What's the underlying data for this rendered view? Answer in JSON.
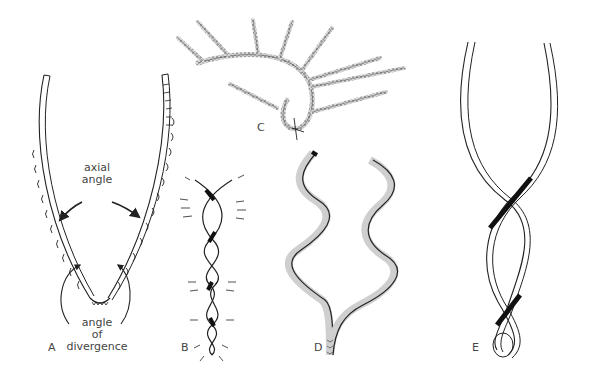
{
  "figure": {
    "panels": [
      {
        "id": "A",
        "label": "A",
        "description": "V-shaped chain with annotated angles"
      },
      {
        "id": "B",
        "label": "B",
        "description": "tightly twisted double helix with spines"
      },
      {
        "id": "C",
        "label": "C",
        "description": "branched chain with stippled filaments"
      },
      {
        "id": "D",
        "label": "D",
        "description": "two undulating chains diverging from a base"
      },
      {
        "id": "E",
        "label": "E",
        "description": "loosely twisted double helix with looped base"
      }
    ],
    "annotations": {
      "axial_angle_line1": "axial",
      "axial_angle_line2": "angle",
      "divergence_line1": "angle",
      "divergence_line2": "of",
      "divergence_line3": "divergence"
    },
    "colors": {
      "ink": "#222222",
      "label": "#444444",
      "background": "#ffffff",
      "stipple": "#8a8a8a"
    }
  }
}
